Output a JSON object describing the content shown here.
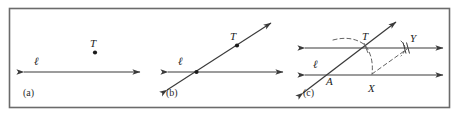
{
  "figure": {
    "border_color": "#6b6b6b",
    "line_color": "#3a3a3a",
    "dash_color": "#5a5a5a",
    "text_color": "#1c1c1c",
    "background": "#ffffff",
    "width": 459,
    "height": 117
  },
  "panels": [
    {
      "id": "a",
      "caption": "(a)",
      "line_label": "ℓ",
      "points": [
        {
          "name": "T",
          "label": "T",
          "dotted": true
        }
      ],
      "description": "A line ℓ with a double arrowhead and a separate point T above it."
    },
    {
      "id": "b",
      "caption": "(b)",
      "line_label": "ℓ",
      "points": [
        {
          "name": "T",
          "label": "T",
          "dotted": true
        },
        {
          "name": "intersection",
          "label": "",
          "dotted": true
        }
      ],
      "description": "A transversal line drawn through T crossing line ℓ."
    },
    {
      "id": "c",
      "caption": "(c)",
      "line_label": "ℓ",
      "points": [
        {
          "name": "T",
          "label": "T",
          "dotted": false
        },
        {
          "name": "A",
          "label": "A",
          "dotted": false
        },
        {
          "name": "X",
          "label": "X",
          "dotted": false
        },
        {
          "name": "Y",
          "label": "Y",
          "dotted": false
        }
      ],
      "description": "Arcs copied at A and T; the parallel line through T is drawn with tick marks at Y."
    }
  ]
}
